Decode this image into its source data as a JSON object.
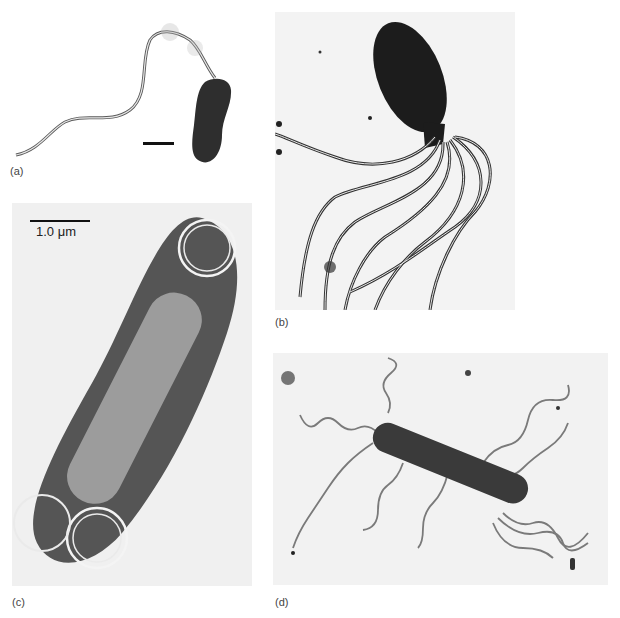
{
  "figure": {
    "panels": [
      {
        "id": "a",
        "label": "(a)",
        "description": "bacterium with single long polar flagellum",
        "scale_bar_text": ""
      },
      {
        "id": "b",
        "label": "(b)",
        "description": "bacterium with tuft of sheathed polar flagella",
        "scale_bar_text": ""
      },
      {
        "id": "c",
        "label": "(c)",
        "description": "rod-shaped bacterium with coiled bipolar flagella, negative stain",
        "scale_bar_text": "1.0 μm"
      },
      {
        "id": "d",
        "label": "(d)",
        "description": "rod-shaped bacterium with peritrichous wavy flagella",
        "scale_bar_text": ""
      }
    ],
    "colors": {
      "background": "#ffffff",
      "micrograph_bg": "#f1f1f1",
      "cell_dark": "#2a2a2a",
      "halo": "#3a3a3a",
      "flagella": "#7a7a7a",
      "label_text": "#444444"
    }
  }
}
